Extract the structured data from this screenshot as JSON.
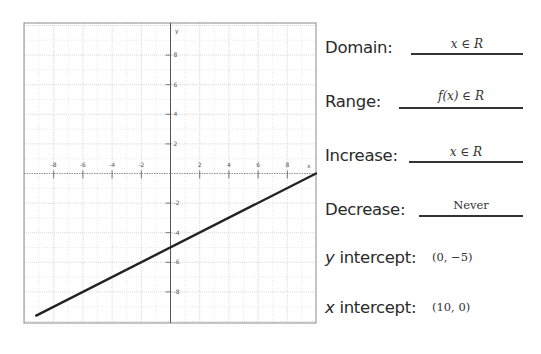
{
  "chart_data": {
    "type": "line",
    "title": "",
    "xlabel": "x",
    "ylabel": "y",
    "xlim": [
      -10.5,
      10
    ],
    "ylim": [
      -10,
      10
    ],
    "x_ticks": [
      -8,
      -6,
      -4,
      -2,
      2,
      4,
      6,
      8
    ],
    "y_ticks": [
      8,
      6,
      4,
      2,
      -2,
      -4,
      -6,
      -8
    ],
    "grid": true,
    "series": [
      {
        "name": "f(x) = 0.5x - 5",
        "x": [
          -9.2,
          10
        ],
        "y": [
          -9.6,
          0
        ],
        "color": "#222222"
      }
    ]
  },
  "properties": {
    "domain": {
      "label": "Domain:",
      "value": "x ∈ R"
    },
    "range": {
      "label": "Range:",
      "value": "f(x) ∈ R"
    },
    "increase": {
      "label": "Increase:",
      "value": "x ∈ R"
    },
    "decrease": {
      "label": "Decrease:",
      "value": "Never"
    },
    "y_intercept": {
      "label_var": "y",
      "label_rest": " intercept:",
      "value": "(0, −5)"
    },
    "x_intercept": {
      "label_var": "x",
      "label_rest": " intercept:",
      "value": "(10, 0)"
    }
  },
  "colors": {
    "line": "#222222",
    "grid": "#c8c8c8",
    "axis": "#555555",
    "border": "#888888"
  }
}
